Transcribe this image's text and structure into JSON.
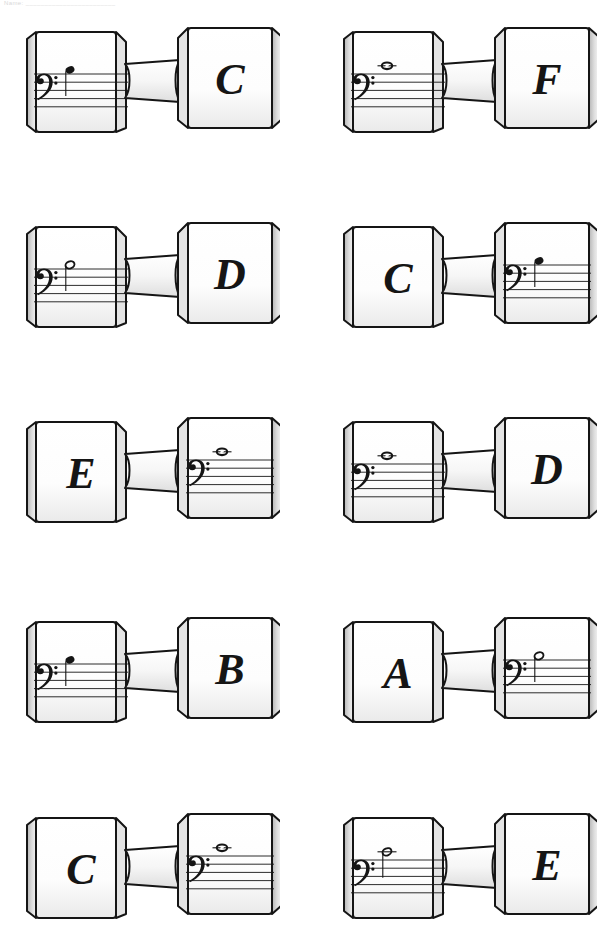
{
  "page": {
    "header_faint_text": "Name: ________________________",
    "background_color": "#ffffff",
    "ink_color": "#151515",
    "shade_color": "#d9d9d9",
    "width": 599,
    "height": 935
  },
  "legend": {
    "clef_name": "bass-clef",
    "clef_glyph": "𝄢",
    "note_types": [
      "quarter",
      "half",
      "whole"
    ]
  },
  "items": [
    {
      "id": "item-1",
      "row": 1,
      "column": 1,
      "x": 20,
      "y": 2,
      "notation_side": "left",
      "letter_side": "right",
      "letter": "C",
      "note": {
        "type": "quarter",
        "staff_position": "above-top-line",
        "ledger_line": false,
        "stem": "down",
        "pitch_letter": "C"
      }
    },
    {
      "id": "item-2",
      "row": 1,
      "column": 2,
      "x": 337,
      "y": 2,
      "notation_side": "left",
      "letter_side": "right",
      "letter": "F",
      "note": {
        "type": "whole",
        "staff_position": "first-ledger-above",
        "ledger_line": true,
        "stem": "none",
        "pitch_letter": "F"
      }
    },
    {
      "id": "item-3",
      "row": 2,
      "column": 1,
      "x": 20,
      "y": 197,
      "notation_side": "left",
      "letter_side": "right",
      "letter": "D",
      "note": {
        "type": "half",
        "staff_position": "above-top-line",
        "ledger_line": false,
        "stem": "down",
        "pitch_letter": "D"
      }
    },
    {
      "id": "item-4",
      "row": 2,
      "column": 2,
      "x": 337,
      "y": 197,
      "notation_side": "right",
      "letter_side": "left",
      "letter": "C",
      "note": {
        "type": "quarter",
        "staff_position": "above-top-line",
        "ledger_line": false,
        "stem": "down",
        "pitch_letter": "C"
      }
    },
    {
      "id": "item-5",
      "row": 3,
      "column": 1,
      "x": 20,
      "y": 392,
      "notation_side": "right",
      "letter_side": "left",
      "letter": "E",
      "note": {
        "type": "whole",
        "staff_position": "first-ledger-above",
        "ledger_line": true,
        "stem": "none",
        "pitch_letter": "E"
      }
    },
    {
      "id": "item-6",
      "row": 3,
      "column": 2,
      "x": 337,
      "y": 392,
      "notation_side": "left",
      "letter_side": "right",
      "letter": "D",
      "note": {
        "type": "whole",
        "staff_position": "first-ledger-above",
        "ledger_line": true,
        "stem": "none",
        "pitch_letter": "D"
      }
    },
    {
      "id": "item-7",
      "row": 4,
      "column": 1,
      "x": 20,
      "y": 592,
      "notation_side": "left",
      "letter_side": "right",
      "letter": "B",
      "note": {
        "type": "quarter",
        "staff_position": "above-top-line",
        "ledger_line": false,
        "stem": "down",
        "pitch_letter": "B"
      }
    },
    {
      "id": "item-8",
      "row": 4,
      "column": 2,
      "x": 337,
      "y": 592,
      "notation_side": "right",
      "letter_side": "left",
      "letter": "A",
      "note": {
        "type": "half",
        "staff_position": "above-top-line",
        "ledger_line": false,
        "stem": "down",
        "pitch_letter": "A"
      }
    },
    {
      "id": "item-9",
      "row": 5,
      "column": 1,
      "x": 20,
      "y": 788,
      "notation_side": "right",
      "letter_side": "left",
      "letter": "C",
      "note": {
        "type": "whole",
        "staff_position": "first-ledger-above",
        "ledger_line": true,
        "stem": "none",
        "pitch_letter": "C"
      }
    },
    {
      "id": "item-10",
      "row": 5,
      "column": 2,
      "x": 337,
      "y": 788,
      "notation_side": "left",
      "letter_side": "right",
      "letter": "E",
      "note": {
        "type": "half",
        "staff_position": "first-ledger-above",
        "ledger_line": true,
        "stem": "down",
        "pitch_letter": "E"
      }
    }
  ]
}
